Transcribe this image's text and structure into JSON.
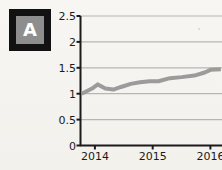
{
  "figure": {
    "panel_label": "A",
    "background_color": "#f6f5f1",
    "badge_border_color": "#121212",
    "badge_fill_color": "#8e8e8e",
    "badge_text_color": "#ffffff"
  },
  "chart_data": {
    "type": "line",
    "title": "",
    "xlabel": "",
    "ylabel": "",
    "xlim": [
      2013.75,
      2016.2
    ],
    "ylim": [
      0,
      2.5
    ],
    "grid": true,
    "grid_axis": "y",
    "legend": "none",
    "line_color": "#9b9b9b",
    "line_width": 4,
    "axis_color": "#1b1b1b",
    "gridline_color": "#b6b6b6",
    "ytick_labels": [
      "0",
      "0.5",
      "1",
      "1.5",
      "2",
      "2.5"
    ],
    "ytick_values": [
      0,
      0.5,
      1,
      1.5,
      2,
      2.5
    ],
    "xtick_labels": [
      "2014",
      "2015",
      "2016"
    ],
    "xtick_values": [
      2014,
      2015,
      2016
    ],
    "series": [
      {
        "name": "A",
        "x": [
          2013.77,
          2013.95,
          2014.05,
          2014.18,
          2014.32,
          2014.45,
          2014.62,
          2014.78,
          2014.95,
          2015.1,
          2015.3,
          2015.5,
          2015.72,
          2015.9,
          2016.0,
          2016.18
        ],
        "values": [
          1.0,
          1.1,
          1.18,
          1.1,
          1.08,
          1.13,
          1.19,
          1.22,
          1.24,
          1.24,
          1.3,
          1.32,
          1.35,
          1.41,
          1.46,
          1.47
        ]
      }
    ]
  }
}
